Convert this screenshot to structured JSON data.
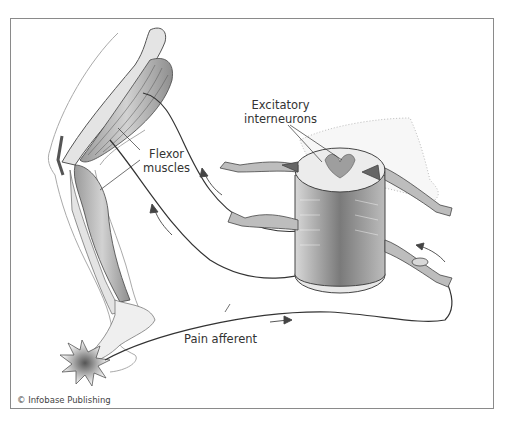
{
  "figure": {
    "labels": {
      "excitatory_interneurons": [
        "Excitatory",
        "interneurons"
      ],
      "flexor_muscles": [
        "Flexor",
        "muscles"
      ],
      "pain_afferent": "Pain afferent"
    },
    "credit": "© Infobase Publishing",
    "colors": {
      "frame": "#8a8a8a",
      "line": "#333333",
      "tissue": "#c8c8c8",
      "bone": "#e4e4e4",
      "text": "#333333"
    }
  }
}
